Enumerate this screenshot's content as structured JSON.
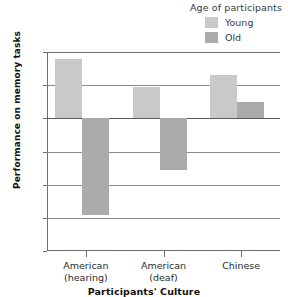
{
  "chart_data": {
    "type": "bar",
    "title": "",
    "xlabel": "Participants' Culture",
    "ylabel": "Performance on memory tasks",
    "categories": [
      "American\n(hearing)",
      "American\n(deaf)",
      "Chinese"
    ],
    "category_lines": [
      [
        "American",
        "(hearing)"
      ],
      [
        "American",
        "(deaf)"
      ],
      [
        "Chinese",
        ""
      ]
    ],
    "series": [
      {
        "name": "Young",
        "color": "#c9c9c9",
        "values": [
          1.8,
          0.95,
          1.3
        ]
      },
      {
        "name": "Old",
        "color": "#ababab",
        "values": [
          -2.9,
          -1.55,
          0.48
        ]
      }
    ],
    "ylim": [
      -4,
      2
    ],
    "yticks": [
      2,
      1,
      0,
      -1,
      -2,
      -3,
      -4
    ],
    "ytick_labels": [
      "2",
      "1",
      "0",
      "-1",
      "-2",
      "-3",
      "-4"
    ],
    "grid": true,
    "legend_position": "top-right"
  },
  "legend": {
    "title": "Age of participants",
    "entries": [
      {
        "label": "Young",
        "color": "#c9c9c9"
      },
      {
        "label": "Old",
        "color": "#ababab"
      }
    ]
  },
  "colors": {
    "young": "#c9c9c9",
    "old": "#ababab",
    "axis": "#6e6e6e",
    "grid": "#8a8a8a",
    "text": "#2b2b2b"
  }
}
